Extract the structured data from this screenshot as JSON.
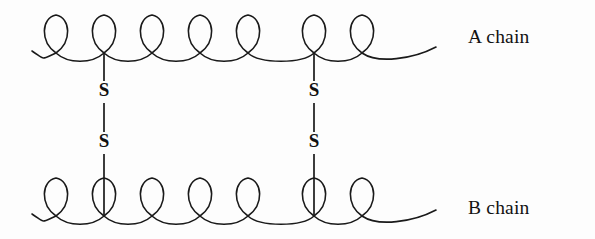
{
  "figure": {
    "background_color": "#fdfdfd",
    "ink_color": "#1a1a1a",
    "width": 595,
    "height": 239
  },
  "chains": [
    {
      "id": "a-chain",
      "label": "A chain",
      "label_x": 468,
      "label_y": 26,
      "baseline_y": 53,
      "loop_direction": "up",
      "start_x": 32,
      "end_x": 436,
      "loop_count": 7,
      "loop_centers": [
        56,
        104,
        152,
        200,
        248,
        314,
        362
      ],
      "loop_height": 38,
      "loop_width": 26,
      "tail_left_dip": 7,
      "tail_right_dip": 7
    },
    {
      "id": "b-chain",
      "label": "B chain",
      "label_x": 468,
      "label_y": 197,
      "baseline_y": 216,
      "loop_direction": "up",
      "start_x": 32,
      "end_x": 436,
      "loop_count": 7,
      "loop_centers": [
        56,
        104,
        152,
        200,
        248,
        314,
        362
      ],
      "loop_height": 38,
      "loop_width": 26,
      "tail_left_dip": 7,
      "tail_right_dip": 7
    }
  ],
  "disulfide_bonds": [
    {
      "id": "bond-left",
      "x": 104,
      "top_y": 53,
      "bottom_y": 216,
      "upper_sulfur": {
        "label": "S",
        "y": 92
      },
      "lower_sulfur": {
        "label": "S",
        "y": 143
      },
      "segments": [
        {
          "y1": 53,
          "y2": 81
        },
        {
          "y1": 103,
          "y2": 132
        },
        {
          "y1": 154,
          "y2": 216
        }
      ]
    },
    {
      "id": "bond-right",
      "x": 314,
      "top_y": 53,
      "bottom_y": 216,
      "upper_sulfur": {
        "label": "S",
        "y": 92
      },
      "lower_sulfur": {
        "label": "S",
        "y": 143
      },
      "segments": [
        {
          "y1": 53,
          "y2": 81
        },
        {
          "y1": 103,
          "y2": 132
        },
        {
          "y1": 154,
          "y2": 216
        }
      ]
    }
  ]
}
